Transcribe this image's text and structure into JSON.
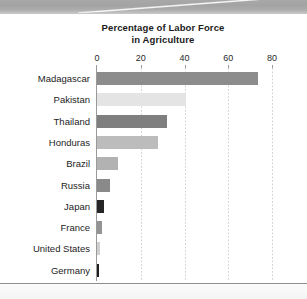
{
  "chart_data": {
    "type": "bar",
    "orientation": "horizontal",
    "title": "Percentage of Labor Force in Agriculture",
    "title_line1": "Percentage of Labor Force",
    "title_line2": "in Agriculture",
    "xlabel": "",
    "ylabel": "",
    "xlim": [
      0,
      80
    ],
    "xticks": [
      0,
      20,
      40,
      60,
      80
    ],
    "xtick_labels": [
      "0",
      "20",
      "40",
      "60",
      "80"
    ],
    "grid": "vertical-dotted",
    "legend": "none",
    "categories": [
      "Madagascar",
      "Pakistan",
      "Thailand",
      "Honduras",
      "Brazil",
      "Russia",
      "Japan",
      "France",
      "United States",
      "Germany"
    ],
    "values": [
      73.5,
      40.5,
      32,
      28,
      9.5,
      6,
      3,
      2.5,
      1.5,
      1
    ],
    "bar_colors": [
      "#8c8c8c",
      "#e4e4e4",
      "#7f7f7f",
      "#bcbcbc",
      "#b2b2b2",
      "#8a8a8a",
      "#262626",
      "#949494",
      "#d0d0d0",
      "#1f1f1f"
    ]
  },
  "axis": {
    "line_color": "#9a9a9a",
    "grid_color": "#d2d2d2"
  },
  "page": {
    "background": "#ffffff",
    "band_color": "#a8a8a8",
    "rule_color": "#8d8d8d"
  }
}
